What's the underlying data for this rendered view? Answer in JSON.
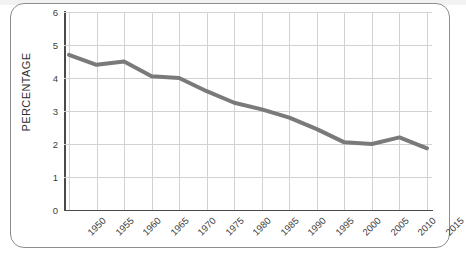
{
  "page": {
    "background": "#ffffff",
    "frame_color": "#8d8d8d"
  },
  "chart_data": {
    "type": "line",
    "title": "",
    "xlabel": "",
    "ylabel": "PERCENTAGE",
    "ylim": [
      0,
      6
    ],
    "xlim": [
      1950,
      2015
    ],
    "grid": true,
    "legend": "none",
    "line_color": "#7a7a7a",
    "line_width": 4,
    "y_ticks": [
      "0",
      "1",
      "2",
      "3",
      "4",
      "5",
      "6"
    ],
    "categories": [
      "1950",
      "1955",
      "1960",
      "1965",
      "1970",
      "1975",
      "1980",
      "1985",
      "1990",
      "1995",
      "2000",
      "2005",
      "2010",
      "2015"
    ],
    "values": [
      4.7,
      4.4,
      4.5,
      4.05,
      4.0,
      3.6,
      3.25,
      3.05,
      2.8,
      2.45,
      2.05,
      2.0,
      2.2,
      1.87
    ]
  }
}
